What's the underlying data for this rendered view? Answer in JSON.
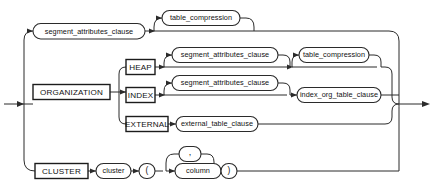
{
  "diagram": {
    "type": "railroad-syntax-diagram",
    "colors": {
      "background": "#ffffff",
      "line": "#2b2b2b",
      "box_stroke": "#1c1c1c",
      "text": "#121212"
    },
    "top_clipped_text": "",
    "entry": {
      "name": "entry-arrow",
      "label": ""
    },
    "exit": {
      "name": "exit-arrow",
      "label": ""
    },
    "branches": [
      {
        "id": "segment-attributes-branch",
        "nodes": [
          {
            "id": "segment_attributes_clause_top",
            "kind": "nonterminal",
            "label": "segment_attributes_clause"
          },
          {
            "id": "table_compression_top",
            "kind": "nonterminal",
            "label": "table_compression"
          }
        ]
      },
      {
        "id": "organization-branch",
        "nodes": [
          {
            "id": "organization_kw",
            "kind": "keyword",
            "label": "ORGANIZATION"
          }
        ],
        "sub_branches": [
          {
            "id": "heap-row",
            "nodes": [
              {
                "id": "heap_kw",
                "kind": "keyword",
                "label": "HEAP"
              },
              {
                "id": "segment_attributes_clause_heap",
                "kind": "nonterminal",
                "label": "segment_attributes_clause"
              },
              {
                "id": "table_compression_heap",
                "kind": "nonterminal",
                "label": "table_compression"
              }
            ]
          },
          {
            "id": "index-row",
            "nodes": [
              {
                "id": "index_kw",
                "kind": "keyword",
                "label": "INDEX"
              },
              {
                "id": "segment_attributes_clause_index",
                "kind": "nonterminal",
                "label": "segment_attributes_clause"
              },
              {
                "id": "index_org_table_clause",
                "kind": "nonterminal",
                "label": "index_org_table_clause"
              }
            ]
          },
          {
            "id": "external-row",
            "nodes": [
              {
                "id": "external_kw",
                "kind": "keyword",
                "label": "EXTERNAL"
              },
              {
                "id": "external_table_clause",
                "kind": "nonterminal",
                "label": "external_table_clause"
              }
            ]
          }
        ]
      },
      {
        "id": "cluster-branch",
        "nodes": [
          {
            "id": "cluster_kw",
            "kind": "keyword",
            "label": "CLUSTER"
          },
          {
            "id": "cluster_name",
            "kind": "nonterminal",
            "label": "cluster"
          },
          {
            "id": "lparen",
            "kind": "terminal",
            "label": "("
          },
          {
            "id": "column_name",
            "kind": "nonterminal",
            "label": "column"
          },
          {
            "id": "comma_loop",
            "kind": "terminal",
            "label": ","
          },
          {
            "id": "rparen",
            "kind": "terminal",
            "label": ")"
          }
        ]
      }
    ],
    "labels": {
      "segment_attributes_clause": "segment_attributes_clause",
      "table_compression": "table_compression",
      "organization": "ORGANIZATION",
      "heap": "HEAP",
      "index": "INDEX",
      "external": "EXTERNAL",
      "index_org_table_clause": "index_org_table_clause",
      "external_table_clause": "external_table_clause",
      "cluster_keyword": "CLUSTER",
      "cluster_term": "cluster",
      "column_term": "column",
      "lparen": "(",
      "rparen": ")",
      "comma": ","
    }
  }
}
